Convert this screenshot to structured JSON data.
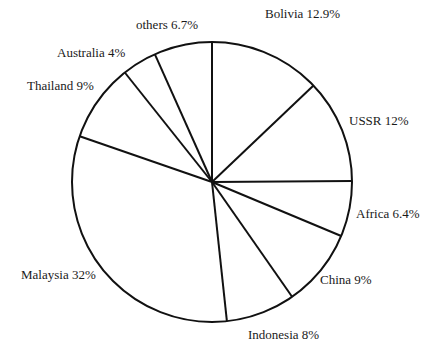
{
  "chart_data": {
    "type": "pie",
    "title": "",
    "start_angle_deg": 0,
    "direction": "clockwise",
    "categories": [
      "Bolivia",
      "USSR",
      "Africa",
      "China",
      "Indonesia",
      "Malaysia",
      "Thailand",
      "Australia",
      "others"
    ],
    "values": [
      12.9,
      12,
      6.4,
      9,
      8,
      32,
      9,
      4,
      6.7
    ],
    "labels": [
      "Bolivia 12.9%",
      "USSR 12%",
      "Africa 6.4%",
      "China 9%",
      "Indonesia 8%",
      "Malaysia 32%",
      "Thailand 9%",
      "Australia 4%",
      "others 6.7%"
    ],
    "label_positions": [
      [
        265,
        18
      ],
      [
        349,
        125
      ],
      [
        356,
        218
      ],
      [
        320,
        284
      ],
      [
        248,
        339
      ],
      [
        21,
        279
      ],
      [
        27,
        90
      ],
      [
        57,
        57
      ],
      [
        136,
        29
      ]
    ],
    "colors": {
      "fill": "#ffffff",
      "stroke": "#111111"
    },
    "legend": "none"
  }
}
